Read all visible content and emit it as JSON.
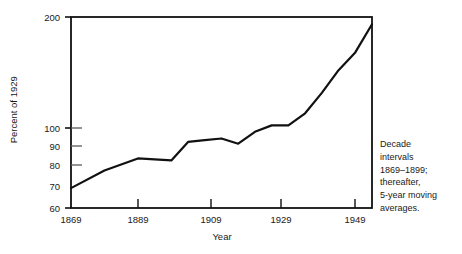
{
  "chart_data": {
    "type": "line",
    "title": "",
    "subtitle": "",
    "xlabel": "Year",
    "ylabel": "Percent of 1929",
    "yscale": "log",
    "ylim": [
      60,
      200
    ],
    "xlim": [
      1869,
      1959
    ],
    "grid": false,
    "legend": null,
    "yticks": [
      60,
      70,
      80,
      90,
      100,
      200
    ],
    "ytick_labels": [
      "60",
      "70",
      "80",
      "90",
      "100",
      "200"
    ],
    "xticks": [
      1869,
      1889,
      1909,
      1929,
      1949
    ],
    "xtick_labels": [
      "1869",
      "1889",
      "1909",
      "1929",
      "1949"
    ],
    "annotation": {
      "lines": [
        "Decade",
        "intervals",
        "1869–1899;",
        "thereafter,",
        "5-year moving",
        "averages."
      ],
      "text": "Decade intervals 1869–1899; thereafter, 5-year moving averages."
    },
    "series": [
      {
        "name": "Percent of 1929",
        "x": [
          1869,
          1879,
          1889,
          1899,
          1904,
          1909,
          1914,
          1919,
          1924,
          1929,
          1934,
          1939,
          1944,
          1949,
          1954,
          1959
        ],
        "values": [
          68,
          76,
          82,
          81,
          91,
          92,
          93,
          90,
          97,
          101,
          101,
          109,
          124,
          143,
          160,
          191
        ]
      }
    ],
    "line_color": "#111111",
    "line_width": 2.2
  },
  "axes": {
    "frame_color": "#111111",
    "background": "#ffffff"
  }
}
